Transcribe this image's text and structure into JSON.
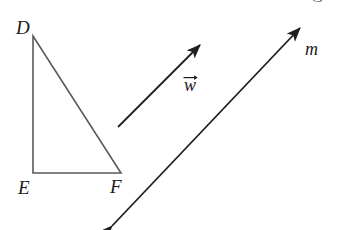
{
  "figure": {
    "background_color": "#ffffff",
    "width": 337,
    "height": 230,
    "triangle": {
      "name": "triangle-DEF",
      "stroke_color": "#5a5a5a",
      "stroke_width": 1.6,
      "vertices": [
        {
          "label": "D",
          "x": 33,
          "y": 36
        },
        {
          "label": "E",
          "x": 33,
          "y": 173
        },
        {
          "label": "F",
          "x": 121,
          "y": 173
        }
      ],
      "vertex_labels": [
        {
          "text": "D",
          "x": 16,
          "y": 18
        },
        {
          "text": "E",
          "x": 18,
          "y": 178
        },
        {
          "text": "F",
          "x": 110,
          "y": 177
        }
      ]
    },
    "vector": {
      "name": "vector-w",
      "label": "w",
      "stroke_color": "#1f1f1f",
      "stroke_width": 1.8,
      "tail": {
        "x": 118,
        "y": 127
      },
      "tip": {
        "x": 200,
        "y": 45
      },
      "label_position": {
        "x": 184,
        "y": 74
      }
    },
    "line": {
      "name": "line-m",
      "label": "m",
      "stroke_color": "#1f1f1f",
      "stroke_width": 1.8,
      "double_headed": true,
      "start": {
        "x": 112,
        "y": 226
      },
      "end": {
        "x": 300,
        "y": 28
      },
      "label_position": {
        "x": 305,
        "y": 40
      }
    },
    "corner_mark": {
      "text": "G",
      "x": 311,
      "y": -12
    }
  }
}
